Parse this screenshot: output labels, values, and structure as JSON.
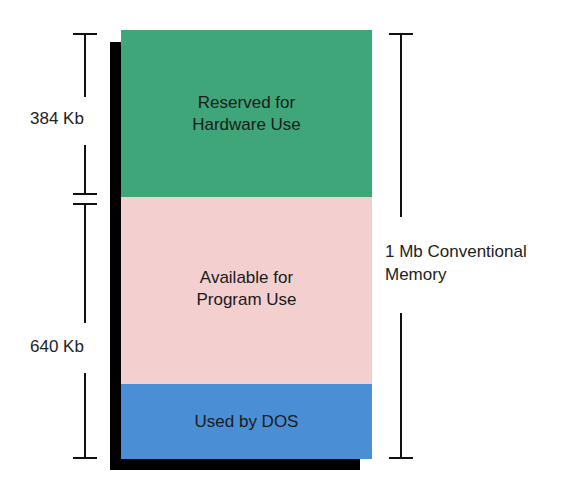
{
  "diagram": {
    "blocks": [
      {
        "id": "hardware",
        "label_line1": "Reserved for",
        "label_line2": "Hardware Use",
        "size": "384 Kb",
        "color": "#3fa67a"
      },
      {
        "id": "program",
        "label_line1": "Available for",
        "label_line2": "Program Use",
        "color": "#f3cfcf"
      },
      {
        "id": "dos",
        "label_line1": "Used by DOS",
        "color": "#4a8fd6"
      }
    ],
    "left_brackets": [
      {
        "label": "384 Kb",
        "spans": "Reserved for Hardware Use"
      },
      {
        "label": "640 Kb",
        "spans": "Available for Program Use + Used by DOS"
      }
    ],
    "right_bracket": {
      "label_line1": "1 Mb Conventional",
      "label_line2": "Memory"
    },
    "shadow_color": "#000000"
  }
}
